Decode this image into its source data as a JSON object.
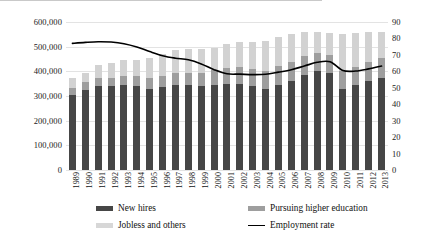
{
  "chart_data": {
    "type": "bar",
    "title": "",
    "subtitle": "",
    "xlabel": "",
    "ylabel": "",
    "grid": true,
    "legend_position": "bottom",
    "categories": [
      "1989",
      "1990",
      "1991",
      "1992",
      "1993",
      "1994",
      "1995",
      "1996",
      "1997",
      "1998",
      "1999",
      "2000",
      "2001",
      "2002",
      "2003",
      "2004",
      "2005",
      "2006",
      "2007",
      "2008",
      "2009",
      "2010",
      "2011",
      "2012",
      "2013"
    ],
    "y_axis_left": {
      "min": 0,
      "max": 600000,
      "step": 100000,
      "ticks": [
        "0",
        "100,000",
        "200,000",
        "300,000",
        "400,000",
        "500,000",
        "600,000"
      ],
      "tick_values": [
        0,
        100000,
        200000,
        300000,
        400000,
        500000,
        600000
      ]
    },
    "y_axis_right": {
      "min": 0,
      "max": 90,
      "step": 10,
      "ticks": [
        "0",
        "10",
        "20",
        "30",
        "40",
        "50",
        "60",
        "70",
        "80",
        "90"
      ],
      "tick_values": [
        0,
        10,
        20,
        30,
        40,
        50,
        60,
        70,
        80,
        90
      ]
    },
    "stacked": true,
    "series": [
      {
        "name": "New hires",
        "type": "bar",
        "axis": "left",
        "color": "#464646",
        "values": [
          305000,
          325000,
          340000,
          340000,
          345000,
          340000,
          330000,
          335000,
          345000,
          345000,
          340000,
          345000,
          350000,
          350000,
          340000,
          330000,
          345000,
          360000,
          385000,
          400000,
          395000,
          330000,
          345000,
          360000,
          375000
        ]
      },
      {
        "name": "Pursuing higher education",
        "type": "bar",
        "axis": "left",
        "color": "#9e9e9e",
        "values": [
          28000,
          30000,
          32000,
          35000,
          38000,
          40000,
          42000,
          45000,
          48000,
          50000,
          55000,
          62000,
          65000,
          68000,
          70000,
          72000,
          75000,
          77000,
          77000,
          75000,
          72000,
          72000,
          74000,
          76000,
          78000
        ]
      },
      {
        "name": "Jobless and others",
        "type": "bar",
        "axis": "left",
        "color": "#d2d2d2",
        "values": [
          42000,
          40000,
          53000,
          60000,
          62000,
          65000,
          83000,
          90000,
          92000,
          95000,
          95000,
          88000,
          95000,
          102000,
          110000,
          123000,
          120000,
          113000,
          98000,
          85000,
          88000,
          148000,
          136000,
          124000,
          107000
        ]
      },
      {
        "name": "Employment rate",
        "type": "line",
        "axis": "right",
        "color": "#000000",
        "values": [
          77.0,
          77.6,
          78.0,
          77.8,
          76.8,
          74.8,
          72.0,
          69.5,
          68.0,
          67.0,
          64.5,
          61.0,
          58.5,
          58.3,
          58.0,
          58.2,
          59.5,
          61.0,
          63.2,
          65.5,
          65.8,
          60.5,
          60.2,
          61.5,
          63.2
        ]
      }
    ],
    "legend": [
      {
        "label": "New hires",
        "color": "#464646",
        "marker": "swatch"
      },
      {
        "label": "Jobless and others",
        "color": "#d7d7d7",
        "marker": "swatch"
      },
      {
        "label": "Pursuing higher education",
        "color": "#9e9e9e",
        "marker": "swatch"
      },
      {
        "label": "Employment rate",
        "color": "#000000",
        "marker": "line"
      }
    ]
  }
}
